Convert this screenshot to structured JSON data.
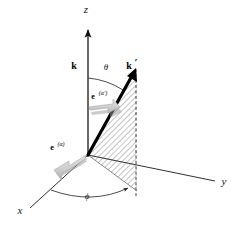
{
  "figure": {
    "background_color": "#ffffff",
    "line_color": "#1a1a1a",
    "bold_vector_color": "#000000",
    "plane_hatch_color": "#8a8a8a",
    "polarization_arrow_color": "#c8c8c8",
    "polarization_arrow_shadow": "#9a9a9a"
  },
  "axes": {
    "z": {
      "label": "z",
      "x": 86,
      "y": 13
    },
    "x": {
      "label": "x",
      "x": 20,
      "y": 214
    },
    "y": {
      "label": "y",
      "x": 224,
      "y": 185
    }
  },
  "vectors": {
    "k_incident": {
      "label": "k",
      "x": 74,
      "y": 69
    },
    "k_scattered": {
      "label": "k",
      "prime": "′",
      "x": 131,
      "y": 69
    },
    "e_incident": {
      "base": "e",
      "superscript": "(α)",
      "x": 52,
      "y": 150
    },
    "e_scattered": {
      "base": "e",
      "superscript": "(α′)",
      "x": 96,
      "y": 99
    }
  },
  "angles": {
    "theta": {
      "label": "θ",
      "x": 106,
      "y": 70
    },
    "phi": {
      "label": "ϕ",
      "x": 87,
      "y": 199
    }
  },
  "scattering_plane": {
    "name": "scattering-plane",
    "fill": "diagonal-hatch",
    "dashed_edge": true
  }
}
